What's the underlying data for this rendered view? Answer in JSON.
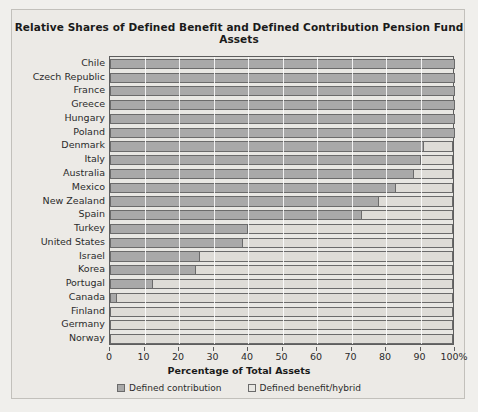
{
  "chart_data": {
    "type": "bar",
    "orientation": "horizontal",
    "stacked": true,
    "title": "Relative Shares of Defined Benefit and Defined Contribution Pension Fund Assets",
    "xlabel": "Percentage of Total Assets",
    "ylabel": "",
    "xlim": [
      0,
      100
    ],
    "grid": true,
    "legend_position": "bottom",
    "xticks": [
      0,
      10,
      20,
      30,
      40,
      50,
      60,
      70,
      80,
      90,
      100
    ],
    "xticklabels": [
      "0",
      "10",
      "20",
      "30",
      "40",
      "50",
      "60",
      "70",
      "80",
      "90",
      "100%"
    ],
    "categories": [
      "Chile",
      "Czech Republic",
      "France",
      "Greece",
      "Hungary",
      "Poland",
      "Denmark",
      "Italy",
      "Australia",
      "Mexico",
      "New Zealand",
      "Spain",
      "Turkey",
      "United States",
      "Israel",
      "Korea",
      "Portugal",
      "Canada",
      "Finland",
      "Germany",
      "Norway"
    ],
    "series": [
      {
        "name": "Defined contribution",
        "color": "#a9a9a9",
        "values": [
          100,
          100,
          100,
          100,
          100,
          100,
          91,
          90,
          88,
          83,
          78,
          73,
          40,
          38.5,
          26,
          25,
          12.5,
          2,
          0,
          0,
          0
        ]
      },
      {
        "name": "Defined benefit/hybrid",
        "color": "#e8e7e3",
        "values": [
          0,
          0,
          0,
          0,
          0,
          0,
          9,
          10,
          12,
          17,
          22,
          27,
          60,
          61.5,
          74,
          75,
          87.5,
          98,
          100,
          100,
          100
        ]
      }
    ]
  },
  "colors": {
    "page_background": "#f0efec",
    "figure_background": "#eceae6",
    "plot_background": "#e8e7e3",
    "bar_defined_contribution": "#a9a9a9",
    "bar_defined_benefit": "#e8e7e3",
    "axis_line": "#5d5d5d",
    "gridline": "#ffffff",
    "text": "#1a1a1a"
  }
}
